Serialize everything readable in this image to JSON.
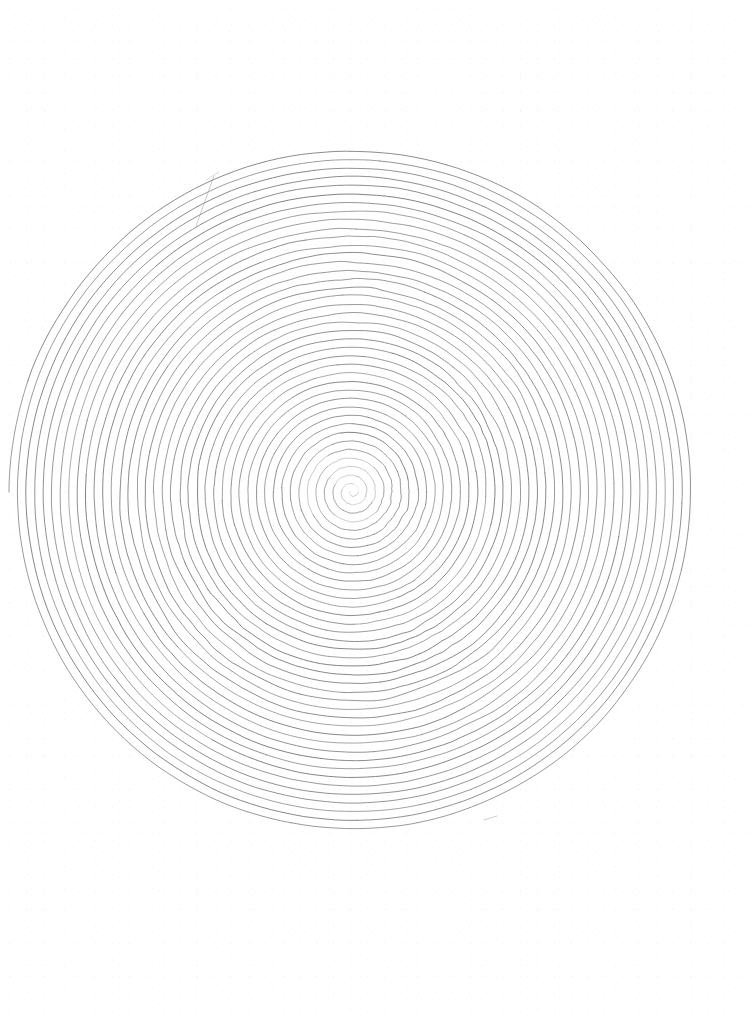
{
  "page": {
    "width": 750,
    "height": 1014,
    "background_color": "#ffffff",
    "medium_description": "graphite pencil on white paper, scanned"
  },
  "artwork": {
    "subject": "concentric hand-drawn spiral",
    "caption": "A single continuous freehand spiral line wound approximately forty times around a central origin, forming a large disc.",
    "stroke_color": "#8e8e92",
    "stroke_color_light": "#b4b4b8",
    "stroke_color_dark": "#6f6f74",
    "stroke_width": 0.85
  },
  "spiral": {
    "type": "archimedean",
    "center_x": 352,
    "center_y": 492,
    "inner_radius": 2,
    "outer_radius": 343,
    "turns": 40,
    "pitch_px": 8.55,
    "direction": "counter-clockwise-outward",
    "samples_per_turn": 190,
    "bounds": {
      "left": 8,
      "top": 153,
      "right": 695,
      "bottom": 835
    }
  },
  "jitter": {
    "base_amplitude_px": 0.55,
    "description": "freehand tremor perpendicular to the stroke",
    "wobble_zones": [
      {
        "name": "upper-left-sector",
        "angle_deg": 118,
        "spread_deg": 34,
        "radius_from": 70,
        "radius_to": 310,
        "amplitude_px": 2.5
      },
      {
        "name": "upper-right-sector",
        "angle_deg": 46,
        "spread_deg": 26,
        "radius_from": 110,
        "radius_to": 280,
        "amplitude_px": 2.1
      },
      {
        "name": "right-sector",
        "angle_deg": 8,
        "spread_deg": 22,
        "radius_from": 120,
        "radius_to": 250,
        "amplitude_px": 1.7
      },
      {
        "name": "lower-center-sector",
        "angle_deg": 268,
        "spread_deg": 30,
        "radius_from": 140,
        "radius_to": 330,
        "amplitude_px": 2.2
      },
      {
        "name": "lower-left-sector",
        "angle_deg": 212,
        "spread_deg": 28,
        "radius_from": 60,
        "radius_to": 240,
        "amplitude_px": 1.9
      },
      {
        "name": "core-sector",
        "angle_deg": 160,
        "spread_deg": 60,
        "radius_from": 8,
        "radius_to": 90,
        "amplitude_px": 1.4
      }
    ]
  },
  "stray_marks": [
    {
      "name": "outer-start-tail",
      "x1": 196,
      "y1": 226,
      "x2": 214,
      "y2": 176,
      "opacity": 0.55
    },
    {
      "name": "lower-right-dash",
      "x1": 484,
      "y1": 820,
      "x2": 497,
      "y2": 816,
      "opacity": 0.5
    },
    {
      "name": "upper-left-nick",
      "x1": 206,
      "y1": 180,
      "x2": 219,
      "y2": 172,
      "opacity": 0.4
    }
  ]
}
